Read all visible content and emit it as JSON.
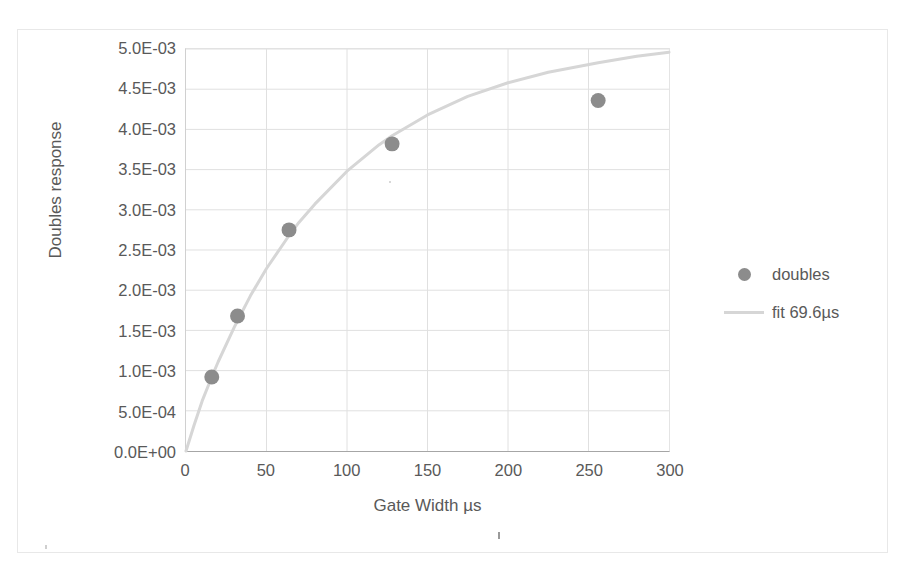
{
  "chart_data": {
    "type": "scatter",
    "title": "",
    "subtitle": "",
    "xlabel": "Gate Width µs",
    "ylabel": "Doubles response",
    "xlim": [
      0,
      300
    ],
    "ylim": [
      0,
      0.005
    ],
    "grid": true,
    "legend_position": "right",
    "x_ticks": [
      {
        "value": 0,
        "label": "0"
      },
      {
        "value": 50,
        "label": "50"
      },
      {
        "value": 100,
        "label": "100"
      },
      {
        "value": 150,
        "label": "150"
      },
      {
        "value": 200,
        "label": "200"
      },
      {
        "value": 250,
        "label": "250"
      },
      {
        "value": 300,
        "label": "300"
      }
    ],
    "y_ticks": [
      {
        "value": 0.0,
        "label": "0.0E+00"
      },
      {
        "value": 0.0005,
        "label": "5.0E-04"
      },
      {
        "value": 0.001,
        "label": "1.0E-03"
      },
      {
        "value": 0.0015,
        "label": "1.5E-03"
      },
      {
        "value": 0.002,
        "label": "2.0E-03"
      },
      {
        "value": 0.0025,
        "label": "2.5E-03"
      },
      {
        "value": 0.003,
        "label": "3.0E-03"
      },
      {
        "value": 0.0035,
        "label": "3.5E-03"
      },
      {
        "value": 0.004,
        "label": "4.0E-03"
      },
      {
        "value": 0.0045,
        "label": "4.5E-03"
      },
      {
        "value": 0.005,
        "label": "5.0E-03"
      }
    ],
    "series": [
      {
        "name": "doubles",
        "type": "scatter",
        "color": "#8c8c8c",
        "marker": "circle",
        "x": [
          16,
          32,
          64,
          128,
          256
        ],
        "values": [
          0.00092,
          0.00168,
          0.00275,
          0.00382,
          0.00436
        ]
      },
      {
        "name": "fit 69.6µs",
        "type": "line",
        "color": "#d6d6d6",
        "tau": 69.6,
        "amplitude": 0.00475,
        "model": "A*(1-exp(-x/tau))",
        "x": [
          0,
          5,
          10,
          16,
          20,
          30,
          32,
          40,
          50,
          64,
          70,
          80,
          100,
          120,
          128,
          150,
          175,
          200,
          225,
          256,
          280,
          300
        ],
        "values": [
          0.0,
          0.00032,
          0.00062,
          0.00092,
          0.00111,
          0.00154,
          0.00162,
          0.00193,
          0.00227,
          0.00268,
          0.00284,
          0.00307,
          0.00348,
          0.00381,
          0.00392,
          0.00418,
          0.00441,
          0.00458,
          0.00471,
          0.00483,
          0.00491,
          0.00496
        ]
      }
    ]
  },
  "legend": {
    "items": [
      {
        "label": "doubles",
        "key": "marker-circle-icon"
      },
      {
        "label": "fit 69.6µs",
        "key": "line-segment-icon"
      }
    ]
  },
  "colors": {
    "marker": "#8c8c8c",
    "fit_line": "#d6d6d6",
    "gridline": "#e0e0e0",
    "axis": "#a6a6a6",
    "text": "#595959",
    "frame": "#e8e8e8"
  }
}
